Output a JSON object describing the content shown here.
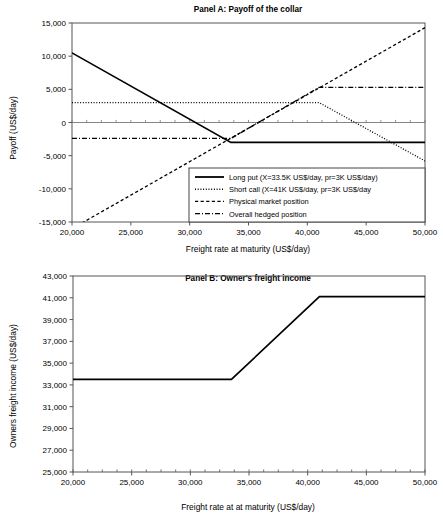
{
  "figure": {
    "panels": [
      "Panel A: Payoff of the collar",
      "Panel B: Owner's freight income"
    ]
  },
  "chart_data": [
    {
      "type": "line",
      "panel": "A",
      "title": "Panel A: Payoff of the collar",
      "xlabel": "Freight rate at maturity (US$/day)",
      "ylabel": "Payoff (US$/day)",
      "xlim": [
        20000,
        50000
      ],
      "ylim": [
        -15000,
        15000
      ],
      "xticks": [
        20000,
        25000,
        30000,
        35000,
        40000,
        45000,
        50000
      ],
      "xticklabels": [
        "20,000",
        "25,000",
        "30,000",
        "35,000",
        "40,000",
        "45,000",
        "50,000"
      ],
      "yticks": [
        -15000,
        -10000,
        -5000,
        0,
        5000,
        10000,
        15000
      ],
      "yticklabels": [
        "-15,000",
        "-10,000",
        "-5,000",
        "0",
        "5,000",
        "10,000",
        "15,000"
      ],
      "grid": false,
      "legend_position": "lower-right",
      "series": [
        {
          "name": "Long put (X=33.5K US$/day, pr=3K US$/day)",
          "style": "solid",
          "x": [
            20000,
            33500,
            50000
          ],
          "y": [
            10500,
            -3000,
            -3000
          ]
        },
        {
          "name": "Short call (X=41K US$/day, pr=3K US$/day",
          "style": "dotted",
          "x": [
            20000,
            41000,
            50000
          ],
          "y": [
            3000,
            3000,
            -5800
          ]
        },
        {
          "name": "Physical market position",
          "style": "dashed",
          "x": [
            20000,
            50000
          ],
          "y": [
            -16000,
            14300
          ]
        },
        {
          "name": "Overall hedged position",
          "style": "dashdot",
          "x": [
            20000,
            33500,
            41000,
            50000
          ],
          "y": [
            -2400,
            -2400,
            5300,
            5300
          ]
        }
      ]
    },
    {
      "type": "line",
      "panel": "B",
      "title": "Panel B: Owner's freight income",
      "xlabel": "Freight rate at at maturity (US$/day)",
      "ylabel": "Owners freight income (US$/day)",
      "xlim": [
        20000,
        50000
      ],
      "ylim": [
        25000,
        43000
      ],
      "xticks": [
        20000,
        25000,
        30000,
        35000,
        40000,
        45000,
        50000
      ],
      "xticklabels": [
        "20,000",
        "25,000",
        "30,000",
        "35,000",
        "40,000",
        "45,000",
        "50,000"
      ],
      "yticks": [
        25000,
        27000,
        29000,
        31000,
        33000,
        35000,
        37000,
        39000,
        41000,
        43000
      ],
      "yticklabels": [
        "25,000",
        "27,000",
        "29,000",
        "31,000",
        "33,000",
        "35,000",
        "37,000",
        "39,000",
        "41,000",
        "43,000"
      ],
      "grid": false,
      "legend_position": "none",
      "series": [
        {
          "name": "Owners freight income",
          "style": "solid",
          "x": [
            20000,
            33500,
            41000,
            50000
          ],
          "y": [
            33500,
            33500,
            41100,
            41100
          ]
        }
      ]
    }
  ],
  "colors": {
    "line": "#000000",
    "axis": "#555555",
    "background": "#ffffff"
  }
}
